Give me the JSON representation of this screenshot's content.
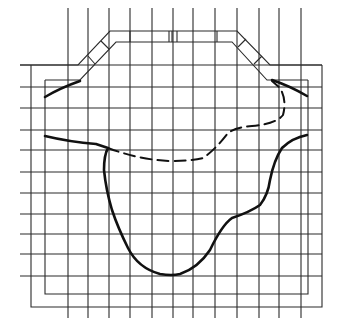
{
  "diagram": {
    "grid": {
      "vertical_x": [
        68,
        88,
        109,
        130,
        152,
        173,
        193,
        215,
        237,
        259,
        279,
        301
      ],
      "horizontal_y": [
        65,
        87,
        108,
        130,
        150,
        172,
        193,
        214,
        234,
        254,
        276
      ],
      "v_top": 8,
      "v_bottom": 318,
      "h_left": 20,
      "h_right": 322
    },
    "colors": {
      "line": "#2a2a2a",
      "curve": "#111111",
      "background": "#ffffff"
    }
  }
}
